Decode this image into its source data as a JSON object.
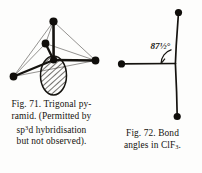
{
  "page": {
    "background_color": "#fdfdfc",
    "ink_color": "#1a1a1a"
  },
  "figures": [
    {
      "id": "fig-71",
      "number": "Fig. 71.",
      "caption_lines": [
        "Fig. 71.  Trigonal py-",
        "ramid. (Permitted by",
        "sp3d hybridisation",
        "but not observed)."
      ],
      "caption_line1": "Fig. 71.  Trigonal py-",
      "caption_line2": "ramid. (Permitted by",
      "caption_line3_pre": "sp",
      "caption_line3_sup": "3",
      "caption_line3_post": "d hybridisation",
      "caption_line4": "but not observed).",
      "diagram": {
        "type": "molecular-geometry",
        "shape": "trigonal-pyramid",
        "central_atom_label": "",
        "vertex_count": 4,
        "lone_pair": "hatched-lobe-below-center",
        "description": "Trigonal pyramid with apical bond up, three basal bonds and a hatched lone-pair lobe pointing down"
      }
    },
    {
      "id": "fig-72",
      "number": "Fig. 72.",
      "caption_lines": [
        "Fig. 72.  Bond",
        "angles in ClF3."
      ],
      "caption_line1": "Fig. 72.  Bond",
      "caption_line2_pre": "angles in ClF",
      "caption_line2_sub": "3",
      "caption_line2_post": ".",
      "diagram": {
        "type": "molecular-geometry",
        "shape": "t-shape",
        "molecule": "ClF3",
        "angle_label": "87½°",
        "angle_value": 87.5,
        "bond_count": 3,
        "description": "T-shaped ClF3 with vertical axis, one horizontal bond to the left, angle marked between them"
      }
    }
  ]
}
